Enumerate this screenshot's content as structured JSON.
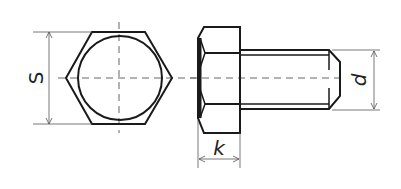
{
  "diagram": {
    "type": "technical-drawing",
    "views": [
      {
        "name": "end view",
        "shape": "hexagon with inscribed circle"
      },
      {
        "name": "side view",
        "shape": "hex head with threaded shank"
      }
    ],
    "dimensions": {
      "s": {
        "label": "S",
        "meaning": "width across flats"
      },
      "k": {
        "label": "k",
        "meaning": "head height"
      },
      "d": {
        "label": "d",
        "meaning": "thread diameter"
      }
    },
    "colors": {
      "line": "#1a1a1a",
      "dimension": "#555555",
      "background": "#ffffff"
    }
  }
}
